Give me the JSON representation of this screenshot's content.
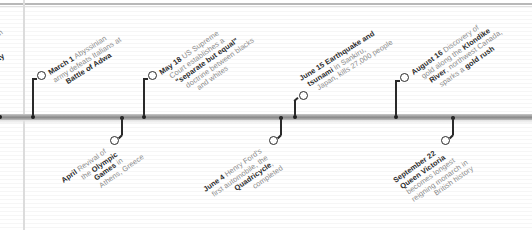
{
  "year_context": "1896",
  "timeline": {
    "bar_color": "#9a9a9a",
    "stem_color": "#2a2a2a",
    "text_color": "#8a8a8a",
    "bold_color": "#2b2b2b"
  },
  "partial_left": {
    "line1": "n",
    "line2": "ay"
  },
  "events_above": [
    {
      "date": "March 1",
      "lines": [
        {
          "bold": "March 1",
          "text": " Abyssinian"
        },
        {
          "bold": "",
          "text": "army defeats Italians at"
        },
        {
          "bold": "Battle of Adwa",
          "text": ""
        }
      ]
    },
    {
      "date": "May 18",
      "lines": [
        {
          "bold": "May 18",
          "text": " US Supreme"
        },
        {
          "bold": "",
          "text": "Court establishes a"
        },
        {
          "bold": "\"separate but equal\"",
          "text": ""
        },
        {
          "bold": "",
          "text": "doctrine between blacks"
        },
        {
          "bold": "",
          "text": "and whites"
        }
      ]
    },
    {
      "date": "June 15",
      "lines": [
        {
          "bold": "June 15 Earthquake and",
          "text": ""
        },
        {
          "bold": "tsunami",
          "text": " in Sankiru,"
        },
        {
          "bold": "",
          "text": "Japan, kills 27,000 people"
        }
      ]
    },
    {
      "date": "August 16",
      "lines": [
        {
          "bold": "August 16",
          "text": " Discovery of"
        },
        {
          "bold": "",
          "text": "gold along the ",
          "bold2": "Klondike"
        },
        {
          "bold": "River",
          "text": ", northwest Canada,"
        },
        {
          "bold": "",
          "text": "sparks a ",
          "bold2": "gold rush"
        }
      ]
    }
  ],
  "events_below": [
    {
      "date": "April",
      "lines": [
        {
          "bold": "April",
          "text": " Revival of"
        },
        {
          "bold": "",
          "text": "the ",
          "bold2": "Olympic"
        },
        {
          "bold": "Games",
          "text": " in"
        },
        {
          "bold": "",
          "text": "Athens, Greece"
        }
      ]
    },
    {
      "date": "June 4",
      "lines": [
        {
          "bold": "June 4",
          "text": " Henry Ford's"
        },
        {
          "bold": "",
          "text": "first automobile, the"
        },
        {
          "bold": "Quadricycle",
          "text": ","
        },
        {
          "bold": "",
          "text": "completed"
        }
      ]
    },
    {
      "date": "September 22",
      "lines": [
        {
          "bold": "September 22",
          "text": ""
        },
        {
          "bold": "Queen Victoria",
          "text": ""
        },
        {
          "bold": "",
          "text": "becomes longest"
        },
        {
          "bold": "",
          "text": "reigning monarch in"
        },
        {
          "bold": "",
          "text": "British history"
        }
      ]
    }
  ]
}
